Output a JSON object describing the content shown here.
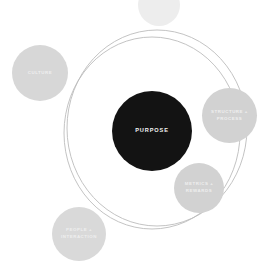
{
  "diagram": {
    "type": "concentric-orbit-bubble-diagram",
    "background_color": "#ffffff",
    "core": {
      "label": "PURPOSE",
      "fill_color": "#131313",
      "text_color": "#f2f2f2",
      "center": {
        "x": 152,
        "y": 131
      },
      "diameter": 80
    },
    "rings": [
      {
        "name": "inner-orbit-ring",
        "stroke_color": "#b9b9b9",
        "center": {
          "x": 152,
          "y": 133
        },
        "radius_x": 88,
        "radius_y": 96
      },
      {
        "name": "outer-orbit-ring",
        "stroke_color": "#b9b9b9",
        "center": {
          "x": 157,
          "y": 128
        },
        "radius_x": 90,
        "radius_y": 98
      }
    ],
    "nodes": [
      {
        "id": "culture",
        "label": "CULTURE",
        "fill_color": "#d7d7d7",
        "text_color": "#efefef",
        "center": {
          "x": 40,
          "y": 73
        },
        "diameter": 56
      },
      {
        "id": "structure-process",
        "label": "STRUCTURE +\nPROCESS",
        "fill_color": "#d2d2d2",
        "text_color": "#efefef",
        "center": {
          "x": 229,
          "y": 115
        },
        "diameter": 55
      },
      {
        "id": "metrics-rewards",
        "label": "METRICS +\nREWARDS",
        "fill_color": "#d2d2d2",
        "text_color": "#efefef",
        "center": {
          "x": 199,
          "y": 188
        },
        "diameter": 50
      },
      {
        "id": "people-interaction",
        "label": "PEOPLE +\nINTERACTION",
        "fill_color": "#d9d9d9",
        "text_color": "#efefef",
        "center": {
          "x": 79,
          "y": 234
        },
        "diameter": 54
      },
      {
        "id": "top-partial",
        "label": "",
        "fill_color": "#ededed",
        "text_color": "#efefef",
        "center": {
          "x": 159,
          "y": 5
        },
        "diameter": 42
      }
    ]
  }
}
